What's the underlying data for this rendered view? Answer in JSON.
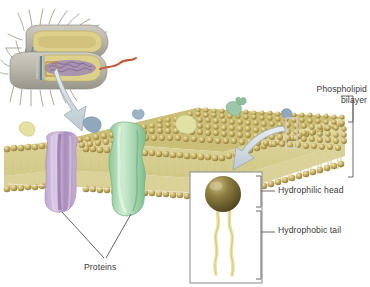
{
  "figure": {
    "type": "biology-diagram",
    "background_color": "#ffffff"
  },
  "labels": {
    "bilayer": "Phospholipid\nbilayer",
    "hydrophilic_head": "Hydrophilic head",
    "hydrophobic_tail": "Hydrophobic tail",
    "proteins": "Proteins"
  },
  "colors": {
    "text": "#3a3a3a",
    "leader_line": "#555555",
    "bracket": "#6b6b6b",
    "head_sphere": "#c9b468",
    "head_sphere_dark": "#8d7a36",
    "head_sphere_light": "#efe4b4",
    "tail": "#e4dc9a",
    "tail_dark": "#b9ad5e",
    "membrane_core": "#ded7a0",
    "protein_purple": "#cdb6d8",
    "protein_purple_dark": "#9e84b0",
    "protein_green": "#a9d6b0",
    "protein_green_dark": "#6fae80",
    "protein_blue": "#8fa8bc",
    "protein_yellow": "#e2e09a",
    "protein_teal": "#9cc8a8",
    "arrow": "#cfd8de",
    "arrow_edge": "#9aa8b2",
    "cell_body": "#b8b6ab",
    "cell_cytoplasm": "#ddd08a",
    "cell_nucleoid": "#9b83b5",
    "cell_pili": "#a9a79c",
    "cell_flagellum": "#c05a3a",
    "inset_border": "#8a8a8a",
    "inset_bg": "#ffffff",
    "highlight_box": "#b98a3c",
    "highlight_box_white": "#f2f2f2"
  },
  "structures": {
    "bacterium": {
      "name": "Bacterial cell cutaway",
      "features": [
        "pili",
        "cell wall",
        "cytoplasm",
        "nucleoid",
        "flagellum",
        "highlight-box"
      ]
    },
    "membrane": {
      "name": "Phospholipid bilayer slab",
      "leaflets": 2,
      "heads_per_row": 44,
      "embedded_proteins": [
        "purple-channel-protein",
        "green-transmembrane-protein"
      ],
      "surface_proteins": [
        "yellow-peripheral",
        "blue-peripheral",
        "yellow-green-peripheral",
        "teal-peripheral",
        "small-blue-peripheral"
      ]
    },
    "inset": {
      "name": "Single phospholipid molecule",
      "parts": [
        "spherical head",
        "two wavy tails"
      ]
    }
  },
  "annotations": {
    "arrow_cell_to_membrane": "curved arrow from bacterium to membrane",
    "arrow_membrane_to_inset": "curved arrow from membrane highlight box to inset",
    "bracket_bilayer": "bracket spanning bilayer thickness",
    "bracket_head": "bracket spanning head region",
    "bracket_tail": "bracket spanning tail region",
    "leader_proteins": "two leader lines from Proteins label"
  }
}
